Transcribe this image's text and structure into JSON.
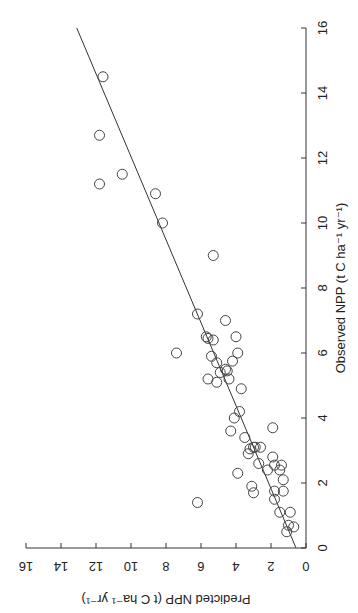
{
  "chart_data": {
    "type": "scatter",
    "title": "",
    "orientation": "rotated 90 degrees; observed axis vertical on right side, predicted axis horizontal along bottom (increasing leftward)",
    "xlabel": "Observed NPP (t C ha⁻¹ yr⁻¹)",
    "ylabel": "Predicted NPP (t C ha⁻¹ yr⁻¹)",
    "xlim": [
      0,
      16
    ],
    "ylim": [
      0,
      16
    ],
    "xticks": [
      0,
      2,
      4,
      6,
      8,
      10,
      12,
      14,
      16
    ],
    "yticks": [
      0,
      2,
      4,
      6,
      8,
      10,
      12,
      14,
      16
    ],
    "grid": false,
    "legend": null,
    "series": [
      {
        "name": "sites",
        "marker": "open-circle",
        "points": [
          {
            "observed": 14.5,
            "predicted": 11.6
          },
          {
            "observed": 12.7,
            "predicted": 11.8
          },
          {
            "observed": 11.5,
            "predicted": 10.5
          },
          {
            "observed": 11.2,
            "predicted": 11.8
          },
          {
            "observed": 10.9,
            "predicted": 8.6
          },
          {
            "observed": 10.0,
            "predicted": 8.2
          },
          {
            "observed": 9.0,
            "predicted": 5.3
          },
          {
            "observed": 7.2,
            "predicted": 6.2
          },
          {
            "observed": 7.0,
            "predicted": 4.6
          },
          {
            "observed": 6.5,
            "predicted": 5.7
          },
          {
            "observed": 6.45,
            "predicted": 5.6
          },
          {
            "observed": 6.4,
            "predicted": 5.3
          },
          {
            "observed": 6.5,
            "predicted": 4.0
          },
          {
            "observed": 6.0,
            "predicted": 7.4
          },
          {
            "observed": 6.0,
            "predicted": 3.9
          },
          {
            "observed": 5.9,
            "predicted": 5.4
          },
          {
            "observed": 5.7,
            "predicted": 5.1
          },
          {
            "observed": 5.75,
            "predicted": 4.2
          },
          {
            "observed": 5.5,
            "predicted": 4.6
          },
          {
            "observed": 5.4,
            "predicted": 4.9
          },
          {
            "observed": 5.45,
            "predicted": 4.5
          },
          {
            "observed": 5.2,
            "predicted": 5.6
          },
          {
            "observed": 5.2,
            "predicted": 4.4
          },
          {
            "observed": 5.1,
            "predicted": 5.1
          },
          {
            "observed": 4.9,
            "predicted": 3.7
          },
          {
            "observed": 4.2,
            "predicted": 3.8
          },
          {
            "observed": 4.0,
            "predicted": 4.1
          },
          {
            "observed": 3.7,
            "predicted": 1.9
          },
          {
            "observed": 3.6,
            "predicted": 4.3
          },
          {
            "observed": 3.4,
            "predicted": 3.5
          },
          {
            "observed": 3.1,
            "predicted": 3.0
          },
          {
            "observed": 3.1,
            "predicted": 2.9
          },
          {
            "observed": 3.1,
            "predicted": 2.6
          },
          {
            "observed": 3.05,
            "predicted": 3.2
          },
          {
            "observed": 2.9,
            "predicted": 3.3
          },
          {
            "observed": 2.8,
            "predicted": 1.9
          },
          {
            "observed": 2.6,
            "predicted": 2.7
          },
          {
            "observed": 2.55,
            "predicted": 1.8
          },
          {
            "observed": 2.55,
            "predicted": 1.4
          },
          {
            "observed": 2.4,
            "predicted": 2.2
          },
          {
            "observed": 2.4,
            "predicted": 1.5
          },
          {
            "observed": 2.3,
            "predicted": 3.9
          },
          {
            "observed": 2.1,
            "predicted": 1.3
          },
          {
            "observed": 1.9,
            "predicted": 3.1
          },
          {
            "observed": 1.7,
            "predicted": 3.0
          },
          {
            "observed": 1.75,
            "predicted": 1.8
          },
          {
            "observed": 1.75,
            "predicted": 1.3
          },
          {
            "observed": 1.5,
            "predicted": 1.8
          },
          {
            "observed": 1.4,
            "predicted": 6.2
          },
          {
            "observed": 1.1,
            "predicted": 1.5
          },
          {
            "observed": 1.1,
            "predicted": 0.9
          },
          {
            "observed": 0.7,
            "predicted": 1.0
          },
          {
            "observed": 0.65,
            "predicted": 0.7
          },
          {
            "observed": 0.5,
            "predicted": 1.1
          }
        ]
      }
    ],
    "regression_line": {
      "observed_from": 0,
      "predicted_from": 0.57,
      "observed_to": 16,
      "predicted_to": 13.1
    }
  },
  "axes": {
    "observed_title": "Observed NPP (t C ha⁻¹ yr⁻¹)",
    "predicted_title": "Predicted NPP (t C ha⁻¹ yr⁻¹)"
  }
}
